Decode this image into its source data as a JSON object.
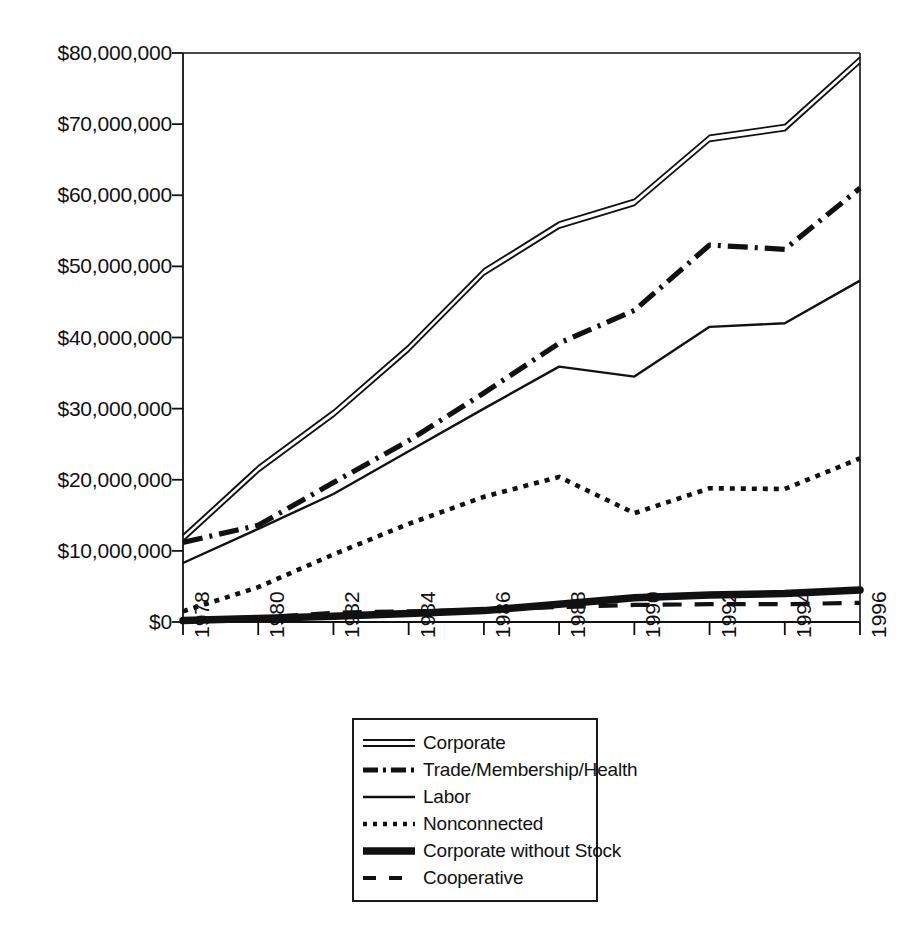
{
  "chart_data": {
    "type": "line",
    "title": "",
    "subtitle": "",
    "xlabel": "",
    "ylabel": "",
    "x": [
      1978,
      1980,
      1982,
      1984,
      1986,
      1988,
      1990,
      1992,
      1994,
      1996
    ],
    "categories": [
      "1978",
      "1980",
      "1982",
      "1984",
      "1986",
      "1988",
      "1990",
      "1992",
      "1994",
      "1996"
    ],
    "xlim": [
      1978,
      1996
    ],
    "ylim": [
      0,
      80000000
    ],
    "ytick_values": [
      0,
      10000000,
      20000000,
      30000000,
      40000000,
      50000000,
      60000000,
      70000000,
      80000000
    ],
    "ytick_labels": [
      "$0",
      "$10,000,000",
      "$20,000,000",
      "$30,000,000",
      "$40,000,000",
      "$50,000,000",
      "$60,000,000",
      "$70,000,000",
      "$80,000,000"
    ],
    "grid": false,
    "legend_position": "bottom-center",
    "line_color": "#111111",
    "series": [
      {
        "name": "Corporate",
        "style": "double-solid",
        "values": [
          11800000,
          21500000,
          29300000,
          38500000,
          49200000,
          55800000,
          59000000,
          68000000,
          69500000,
          79000000
        ]
      },
      {
        "name": "Trade/Membership/Health",
        "style": "dash-dot",
        "values": [
          11200000,
          13600000,
          19600000,
          25500000,
          32200000,
          39200000,
          43800000,
          53000000,
          52400000,
          61000000
        ]
      },
      {
        "name": "Labor",
        "style": "thin-solid",
        "values": [
          8300000,
          13100000,
          18000000,
          24000000,
          30000000,
          35900000,
          34500000,
          41500000,
          42000000,
          48000000
        ]
      },
      {
        "name": "Nonconnected",
        "style": "dotted",
        "values": [
          1500000,
          4900000,
          9500000,
          13800000,
          17600000,
          20400000,
          15300000,
          18800000,
          18700000,
          23000000
        ]
      },
      {
        "name": "Corporate without Stock",
        "style": "thick-solid",
        "values": [
          200000,
          500000,
          800000,
          1200000,
          1600000,
          2500000,
          3400000,
          3800000,
          4000000,
          4500000
        ]
      },
      {
        "name": "Cooperative",
        "style": "dashed",
        "values": [
          100000,
          600000,
          1300000,
          1500000,
          1700000,
          2100000,
          2400000,
          2500000,
          2500000,
          2700000
        ]
      }
    ]
  },
  "legend": {
    "items": [
      {
        "label": "Corporate",
        "key": "double-solid-line-key"
      },
      {
        "label": "Trade/Membership/Health",
        "key": "dash-dot-line-key"
      },
      {
        "label": "Labor",
        "key": "thin-solid-line-key"
      },
      {
        "label": "Nonconnected",
        "key": "dotted-line-key"
      },
      {
        "label": "Corporate without Stock",
        "key": "thick-solid-line-key"
      },
      {
        "label": "Cooperative",
        "key": "dashed-line-key"
      }
    ]
  }
}
